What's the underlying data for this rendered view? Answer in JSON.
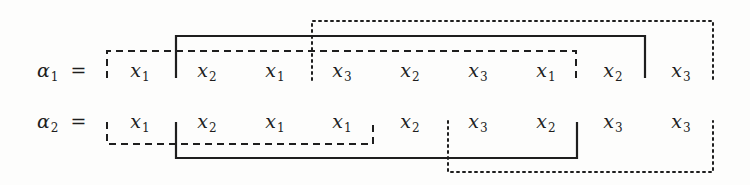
{
  "diagram": {
    "rows": [
      {
        "label_symbol": "α",
        "label_sub": "1",
        "label_eq": "=",
        "y": 72,
        "cells": [
          {
            "sym": "x",
            "sub": "1"
          },
          {
            "sym": "x",
            "sub": "2"
          },
          {
            "sym": "x",
            "sub": "1"
          },
          {
            "sym": "x",
            "sub": "3"
          },
          {
            "sym": "x",
            "sub": "2"
          },
          {
            "sym": "x",
            "sub": "3"
          },
          {
            "sym": "x",
            "sub": "1"
          },
          {
            "sym": "x",
            "sub": "2"
          },
          {
            "sym": "x",
            "sub": "3"
          }
        ]
      },
      {
        "label_symbol": "α",
        "label_sub": "2",
        "label_eq": "=",
        "y": 123,
        "cells": [
          {
            "sym": "x",
            "sub": "1"
          },
          {
            "sym": "x",
            "sub": "2"
          },
          {
            "sym": "x",
            "sub": "1"
          },
          {
            "sym": "x",
            "sub": "1"
          },
          {
            "sym": "x",
            "sub": "2"
          },
          {
            "sym": "x",
            "sub": "3"
          },
          {
            "sym": "x",
            "sub": "2"
          },
          {
            "sym": "x",
            "sub": "3"
          },
          {
            "sym": "x",
            "sub": "3"
          }
        ]
      }
    ],
    "column_x": [
      140,
      207,
      275,
      342,
      410,
      478,
      546,
      613,
      681
    ],
    "brackets": {
      "row1": {
        "dashed": {
          "x1": 107,
          "x2": 576,
          "y_top": 51,
          "y_bottom": 78,
          "style": "dashed"
        },
        "solid": {
          "x1": 176,
          "x2": 645,
          "y_top": 36,
          "y_bottom": 78,
          "style": "solid"
        },
        "dotted": {
          "x1": 312,
          "x2": 713,
          "y_top": 21,
          "y_bottom": 80,
          "style": "dotted"
        }
      },
      "row2": {
        "dashed": {
          "x1": 107,
          "x2": 373,
          "y_top": 122,
          "y_bottom": 144,
          "style": "dashed"
        },
        "solid": {
          "x1": 176,
          "x2": 577,
          "y_top": 122,
          "y_bottom": 158,
          "style": "solid"
        },
        "dotted": {
          "x1": 448,
          "x2": 713,
          "y_top": 121,
          "y_bottom": 172,
          "style": "dotted"
        }
      }
    },
    "colors": {
      "ink": "#1e1e1e",
      "background": "#fdfdfc"
    }
  }
}
